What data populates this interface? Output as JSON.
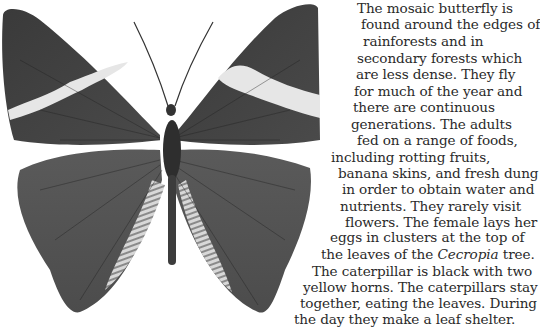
{
  "figure": {
    "icon": "butterfly-illustration"
  },
  "article": {
    "lines": [
      {
        "text": "The mosaic butterfly is",
        "x": 357,
        "y": 0
      },
      {
        "text": "found around the edges of",
        "x": 361,
        "y": 16
      },
      {
        "text": "rainforests and in",
        "x": 363,
        "y": 33
      },
      {
        "text": "secondary forests which",
        "x": 357,
        "y": 50
      },
      {
        "text": "are less dense. They fly",
        "x": 356,
        "y": 66
      },
      {
        "text": "for much of the year and",
        "x": 354,
        "y": 83
      },
      {
        "text": "there are continuous",
        "x": 353,
        "y": 99
      },
      {
        "text": "generations. The adults",
        "x": 351,
        "y": 116
      },
      {
        "text": "fed on a range of foods,",
        "x": 357,
        "y": 132
      },
      {
        "text": "including rotting fruits,",
        "x": 331,
        "y": 149
      },
      {
        "text": "banana skins, and fresh dung",
        "x": 338,
        "y": 165
      },
      {
        "text": "in order to obtain water and",
        "x": 342,
        "y": 181
      },
      {
        "text": "nutrients. They rarely visit",
        "x": 340,
        "y": 198
      },
      {
        "text": "flowers. The female lays her",
        "x": 345,
        "y": 214
      },
      {
        "text": "eggs in clusters at the top of",
        "x": 330,
        "y": 229
      },
      {
        "text": "the leaves of the ",
        "italic": "Cecropia",
        "after": " tree.",
        "x": 321,
        "y": 246
      },
      {
        "text": "The caterpillar is black with two",
        "x": 312,
        "y": 263
      },
      {
        "text": "yellow horns. The caterpillars stay",
        "x": 303,
        "y": 279
      },
      {
        "text": "together, eating the leaves. During",
        "x": 300,
        "y": 295
      },
      {
        "text": "the day they make a leaf shelter.",
        "x": 294,
        "y": 311
      }
    ]
  }
}
